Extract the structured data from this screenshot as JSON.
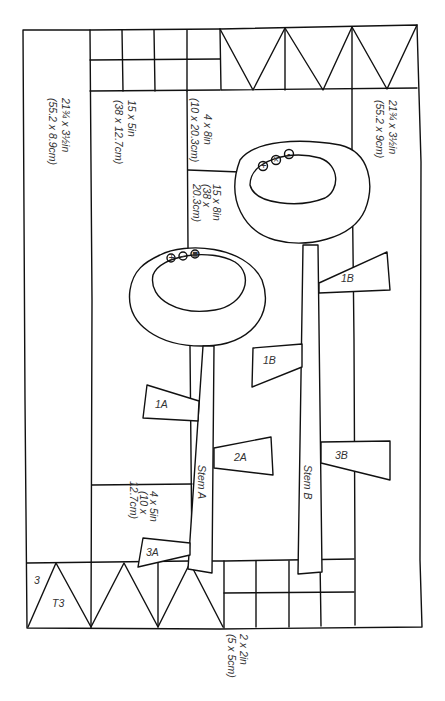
{
  "diagram": {
    "type": "quilt-pattern-layout",
    "colors": {
      "line": "#111111",
      "text": "#333333",
      "background": "#ffffff"
    },
    "dimension_labels": {
      "left_border": [
        "21¾ x 3½in",
        "(55.2 x 8.9cm)"
      ],
      "left_panel": [
        "15 x 5in",
        "(38 x 12.7cm)"
      ],
      "upper_strip": [
        "4 x 8in",
        "(10 x 20.3cm)"
      ],
      "middle_panel": [
        "15 x 8in",
        "(38 x",
        "20.3cm)"
      ],
      "right_border": [
        "21¾ x 3½in",
        "(55.2 x 9cm)"
      ],
      "lower_block": [
        "4 x 5in",
        "(10 x",
        "12.7cm)"
      ],
      "squares": [
        "2 x 2in",
        "(5 x 5cm)"
      ]
    },
    "pieces": {
      "stem_a": "Stem A",
      "stem_b": "Stem B",
      "leaf_1a": "1A",
      "leaf_2a": "2A",
      "leaf_3a": "3A",
      "leaf_1b_upper": "1B",
      "leaf_1b_lower": "1B",
      "leaf_3b": "3B",
      "triangle_num": "3",
      "triangle_label": "T3"
    },
    "flower_buttons": {
      "flower_a": [
        "+",
        "-",
        "■"
      ],
      "flower_b": [
        "+",
        "×",
        "-"
      ]
    }
  }
}
